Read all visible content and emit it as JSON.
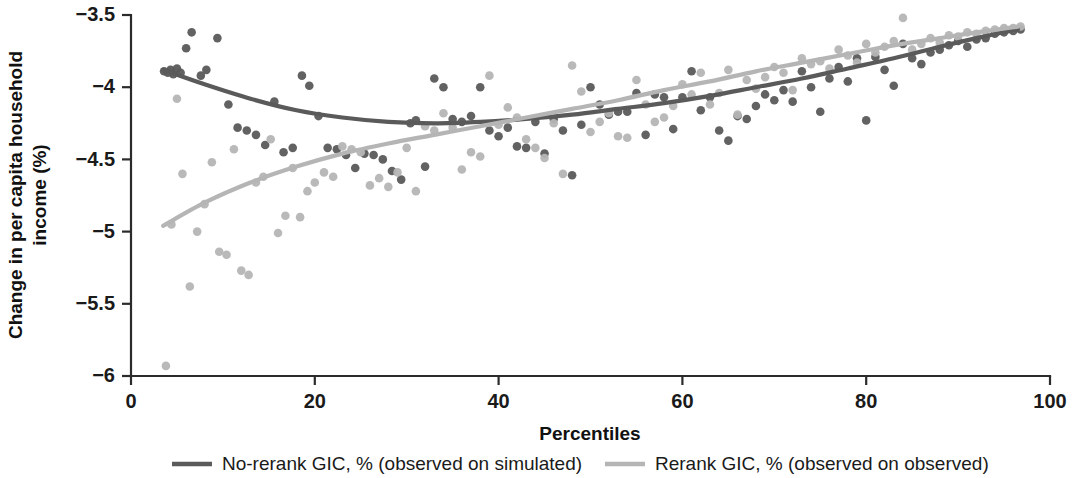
{
  "figure": {
    "background": "#ffffff"
  },
  "axes": {
    "x_title": "Percentiles",
    "y_title_line1": "Change in per capita household",
    "y_title_line2": "income (%)",
    "x_ticks": [
      "0",
      "20",
      "40",
      "60",
      "80",
      "100"
    ],
    "y_ticks": [
      "−3.5",
      "−4",
      "−4.5",
      "−5",
      "−5.5",
      "−6"
    ]
  },
  "legend": {
    "items": [
      {
        "label": "No-rerank GIC, % (observed on simulated)",
        "color": "#5a5a5a"
      },
      {
        "label": "Rerank GIC, % (observed on observed)",
        "color": "#b5b5b5"
      }
    ]
  },
  "colors": {
    "no_rerank": "#5a5a5a",
    "rerank": "#b5b5b5",
    "axis": "#2b2b2b",
    "text": "#1a1a1a"
  },
  "chart_data": {
    "type": "scatter",
    "title": "",
    "subtitle": "",
    "xlabel": "Percentiles",
    "ylabel": "Change in per capita household income (%)",
    "xlim": [
      0,
      100
    ],
    "ylim": [
      -6,
      -3.5
    ],
    "xticks": [
      0,
      20,
      40,
      60,
      80,
      100
    ],
    "yticks": [
      -6,
      -5.5,
      -5,
      -4.5,
      -4,
      -3.5
    ],
    "grid": false,
    "legend_position": "bottom",
    "series": [
      {
        "name": "No-rerank GIC, % (observed on simulated)",
        "color": "#5a5a5a",
        "marker": "circle",
        "points": [
          [
            3.6,
            -3.89
          ],
          [
            4.0,
            -3.9
          ],
          [
            4.3,
            -3.88
          ],
          [
            4.6,
            -3.91
          ],
          [
            5.0,
            -3.87
          ],
          [
            5.4,
            -3.9
          ],
          [
            6.0,
            -3.73
          ],
          [
            6.6,
            -3.62
          ],
          [
            7.6,
            -3.92
          ],
          [
            8.2,
            -3.88
          ],
          [
            9.4,
            -3.66
          ],
          [
            10.6,
            -4.12
          ],
          [
            11.6,
            -4.28
          ],
          [
            12.6,
            -4.3
          ],
          [
            13.6,
            -4.33
          ],
          [
            14.6,
            -4.4
          ],
          [
            15.6,
            -4.1
          ],
          [
            16.6,
            -4.45
          ],
          [
            17.6,
            -4.42
          ],
          [
            18.6,
            -3.92
          ],
          [
            19.4,
            -3.99
          ],
          [
            20.4,
            -4.2
          ],
          [
            21.4,
            -4.42
          ],
          [
            22.4,
            -4.43
          ],
          [
            23.4,
            -4.47
          ],
          [
            24.4,
            -4.56
          ],
          [
            25.4,
            -4.46
          ],
          [
            26.4,
            -4.47
          ],
          [
            27.4,
            -4.5
          ],
          [
            28.4,
            -4.58
          ],
          [
            29.4,
            -4.64
          ],
          [
            30.4,
            -4.25
          ],
          [
            31.0,
            -4.23
          ],
          [
            32.0,
            -4.55
          ],
          [
            33.0,
            -3.94
          ],
          [
            34.0,
            -4.0
          ],
          [
            35.0,
            -4.22
          ],
          [
            36.0,
            -4.24
          ],
          [
            37.0,
            -4.2
          ],
          [
            38.0,
            -4.0
          ],
          [
            39.0,
            -4.3
          ],
          [
            40.0,
            -4.34
          ],
          [
            41.0,
            -4.28
          ],
          [
            42.0,
            -4.41
          ],
          [
            43.0,
            -4.42
          ],
          [
            44.0,
            -4.24
          ],
          [
            45.0,
            -4.46
          ],
          [
            46.0,
            -4.22
          ],
          [
            47.0,
            -4.3
          ],
          [
            48.0,
            -4.61
          ],
          [
            49.0,
            -4.26
          ],
          [
            50.0,
            -4.0
          ],
          [
            51.0,
            -4.12
          ],
          [
            52.0,
            -4.19
          ],
          [
            53.0,
            -4.17
          ],
          [
            54.0,
            -4.17
          ],
          [
            55.0,
            -4.04
          ],
          [
            56.0,
            -4.33
          ],
          [
            57.0,
            -4.05
          ],
          [
            58.0,
            -4.07
          ],
          [
            59.0,
            -4.29
          ],
          [
            60.0,
            -4.07
          ],
          [
            61.0,
            -3.89
          ],
          [
            62.0,
            -4.16
          ],
          [
            63.0,
            -4.07
          ],
          [
            64.0,
            -4.3
          ],
          [
            65.0,
            -4.37
          ],
          [
            66.0,
            -4.2
          ],
          [
            67.0,
            -4.22
          ],
          [
            68.0,
            -4.13
          ],
          [
            69.0,
            -4.05
          ],
          [
            70.0,
            -4.09
          ],
          [
            71.0,
            -4.02
          ],
          [
            72.0,
            -4.1
          ],
          [
            73.0,
            -3.89
          ],
          [
            74.0,
            -4.0
          ],
          [
            75.0,
            -4.17
          ],
          [
            76.0,
            -3.94
          ],
          [
            77.0,
            -3.86
          ],
          [
            78.0,
            -3.96
          ],
          [
            79.0,
            -3.8
          ],
          [
            80.0,
            -4.23
          ],
          [
            81.0,
            -3.79
          ],
          [
            82.0,
            -3.88
          ],
          [
            83.0,
            -3.99
          ],
          [
            84.0,
            -3.7
          ],
          [
            85.0,
            -3.8
          ],
          [
            86.0,
            -3.84
          ],
          [
            87.0,
            -3.76
          ],
          [
            88.0,
            -3.74
          ],
          [
            89.0,
            -3.71
          ],
          [
            90.0,
            -3.68
          ],
          [
            91.0,
            -3.72
          ],
          [
            92.0,
            -3.67
          ],
          [
            93.0,
            -3.66
          ],
          [
            94.0,
            -3.63
          ],
          [
            95.0,
            -3.62
          ],
          [
            96.0,
            -3.61
          ],
          [
            96.8,
            -3.6
          ]
        ]
      },
      {
        "name": "Rerank GIC, % (observed on observed)",
        "color": "#b5b5b5",
        "marker": "circle",
        "points": [
          [
            3.8,
            -5.93
          ],
          [
            4.4,
            -4.95
          ],
          [
            5.0,
            -4.08
          ],
          [
            5.6,
            -4.6
          ],
          [
            6.4,
            -5.38
          ],
          [
            7.2,
            -5.0
          ],
          [
            8.0,
            -4.81
          ],
          [
            8.8,
            -4.52
          ],
          [
            9.6,
            -5.14
          ],
          [
            10.4,
            -5.16
          ],
          [
            11.2,
            -4.43
          ],
          [
            12.0,
            -5.27
          ],
          [
            12.8,
            -5.3
          ],
          [
            13.6,
            -4.66
          ],
          [
            14.4,
            -4.62
          ],
          [
            15.2,
            -4.36
          ],
          [
            16.0,
            -5.01
          ],
          [
            16.8,
            -4.89
          ],
          [
            17.6,
            -4.56
          ],
          [
            18.4,
            -4.9
          ],
          [
            19.2,
            -4.72
          ],
          [
            20.0,
            -4.66
          ],
          [
            21.0,
            -4.59
          ],
          [
            22.0,
            -4.62
          ],
          [
            23.0,
            -4.41
          ],
          [
            24.0,
            -4.43
          ],
          [
            25.0,
            -4.45
          ],
          [
            26.0,
            -4.68
          ],
          [
            27.0,
            -4.63
          ],
          [
            28.0,
            -4.69
          ],
          [
            29.0,
            -4.59
          ],
          [
            30.0,
            -4.42
          ],
          [
            31.0,
            -4.72
          ],
          [
            32.0,
            -4.27
          ],
          [
            33.0,
            -4.3
          ],
          [
            34.0,
            -4.18
          ],
          [
            35.0,
            -4.28
          ],
          [
            36.0,
            -4.57
          ],
          [
            37.0,
            -4.45
          ],
          [
            38.0,
            -4.48
          ],
          [
            39.0,
            -3.92
          ],
          [
            40.0,
            -4.26
          ],
          [
            41.0,
            -4.14
          ],
          [
            42.0,
            -4.21
          ],
          [
            43.0,
            -4.36
          ],
          [
            44.0,
            -4.42
          ],
          [
            45.0,
            -4.49
          ],
          [
            46.0,
            -4.25
          ],
          [
            47.0,
            -4.6
          ],
          [
            48.0,
            -3.85
          ],
          [
            49.0,
            -4.03
          ],
          [
            50.0,
            -4.31
          ],
          [
            51.0,
            -4.24
          ],
          [
            52.0,
            -4.18
          ],
          [
            53.0,
            -4.34
          ],
          [
            54.0,
            -4.35
          ],
          [
            55.0,
            -3.95
          ],
          [
            56.0,
            -4.12
          ],
          [
            57.0,
            -4.24
          ],
          [
            58.0,
            -4.21
          ],
          [
            59.0,
            -4.13
          ],
          [
            60.0,
            -3.98
          ],
          [
            61.0,
            -4.05
          ],
          [
            62.0,
            -3.9
          ],
          [
            63.0,
            -4.12
          ],
          [
            64.0,
            -4.04
          ],
          [
            65.0,
            -3.88
          ],
          [
            66.0,
            -4.19
          ],
          [
            67.0,
            -3.95
          ],
          [
            68.0,
            -4.01
          ],
          [
            69.0,
            -3.93
          ],
          [
            70.0,
            -3.86
          ],
          [
            71.0,
            -3.9
          ],
          [
            72.0,
            -4.02
          ],
          [
            73.0,
            -3.8
          ],
          [
            74.0,
            -3.84
          ],
          [
            75.0,
            -3.82
          ],
          [
            76.0,
            -3.87
          ],
          [
            77.0,
            -3.74
          ],
          [
            78.0,
            -3.78
          ],
          [
            79.0,
            -3.83
          ],
          [
            80.0,
            -3.7
          ],
          [
            81.0,
            -3.76
          ],
          [
            82.0,
            -3.72
          ],
          [
            83.0,
            -3.68
          ],
          [
            84.0,
            -3.52
          ],
          [
            85.0,
            -3.74
          ],
          [
            86.0,
            -3.7
          ],
          [
            87.0,
            -3.66
          ],
          [
            88.0,
            -3.69
          ],
          [
            89.0,
            -3.64
          ],
          [
            90.0,
            -3.65
          ],
          [
            91.0,
            -3.62
          ],
          [
            92.0,
            -3.63
          ],
          [
            93.0,
            -3.61
          ],
          [
            94.0,
            -3.6
          ],
          [
            95.0,
            -3.59
          ],
          [
            96.0,
            -3.59
          ],
          [
            96.8,
            -3.58
          ]
        ]
      }
    ],
    "fits": [
      {
        "name": "No-rerank GIC fit",
        "color": "#5a5a5a",
        "x": [
          3.5,
          8,
          13,
          18,
          23,
          28,
          33,
          38,
          43,
          48,
          53,
          58,
          63,
          68,
          73,
          78,
          83,
          88,
          92,
          96.5
        ],
        "y": [
          -3.88,
          -3.98,
          -4.08,
          -4.16,
          -4.21,
          -4.24,
          -4.25,
          -4.24,
          -4.22,
          -4.19,
          -4.15,
          -4.11,
          -4.06,
          -4.0,
          -3.94,
          -3.87,
          -3.8,
          -3.72,
          -3.66,
          -3.6
        ]
      },
      {
        "name": "Rerank GIC fit",
        "color": "#b5b5b5",
        "x": [
          3.5,
          8,
          13,
          18,
          23,
          28,
          33,
          38,
          43,
          48,
          53,
          58,
          63,
          68,
          73,
          78,
          83,
          88,
          92,
          96.5
        ],
        "y": [
          -4.96,
          -4.8,
          -4.66,
          -4.55,
          -4.46,
          -4.39,
          -4.33,
          -4.27,
          -4.21,
          -4.15,
          -4.09,
          -4.02,
          -3.96,
          -3.89,
          -3.83,
          -3.77,
          -3.71,
          -3.66,
          -3.62,
          -3.58
        ]
      }
    ]
  }
}
